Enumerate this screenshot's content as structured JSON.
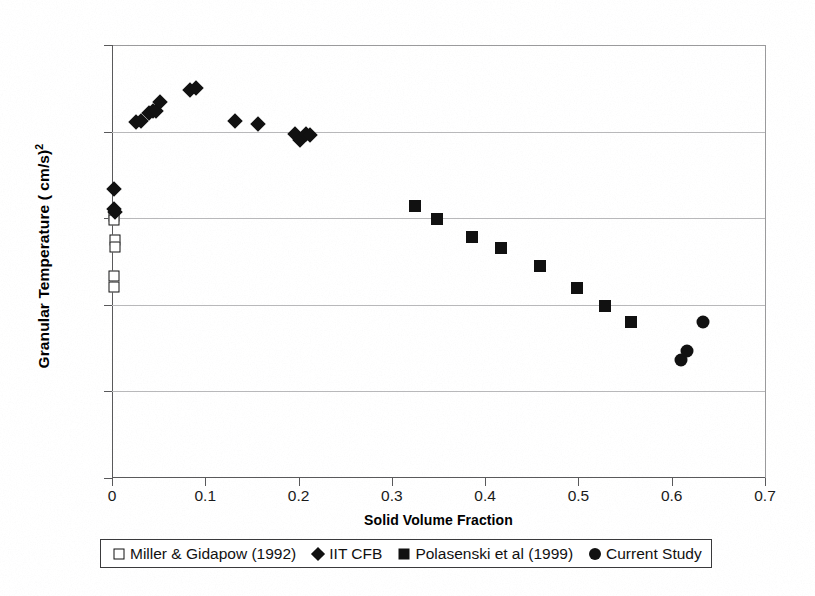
{
  "chart_data": {
    "type": "scatter",
    "title": "",
    "xlabel": "Solid Volume Fraction",
    "ylabel": "Granular Temperature ( cm/s)",
    "ylabel_exponent": "2",
    "xlim": [
      0,
      0.7
    ],
    "ylim": [
      1,
      100000
    ],
    "yscale": "log",
    "xscale": "linear",
    "grid": "horizontal",
    "legend_position": "below-plot",
    "xticks": [
      "0",
      "0.1",
      "0.2",
      "0.3",
      "0.4",
      "0.5",
      "0.6",
      "0.7"
    ],
    "xtick_values": [
      0,
      0.1,
      0.2,
      0.3,
      0.4,
      0.5,
      0.6,
      0.7
    ],
    "yticks": [
      "1",
      "10",
      "100",
      "1000",
      "10000",
      "100000"
    ],
    "ytick_values": [
      1,
      10,
      100,
      1000,
      10000,
      100000
    ],
    "marker_color": "#111111",
    "series": [
      {
        "name": "Miller & Gidapow (1992)",
        "marker": "open-square",
        "points": [
          [
            0.002,
            1050
          ],
          [
            0.002,
            960
          ],
          [
            0.003,
            560
          ],
          [
            0.003,
            470
          ],
          [
            0.002,
            215
          ],
          [
            0.002,
            160
          ]
        ]
      },
      {
        "name": "IIT CFB",
        "marker": "filled-diamond",
        "points": [
          [
            0.002,
            2150
          ],
          [
            0.002,
            1280
          ],
          [
            0.0035,
            1180
          ],
          [
            0.026,
            12800
          ],
          [
            0.031,
            13300
          ],
          [
            0.04,
            16500
          ],
          [
            0.044,
            17200
          ],
          [
            0.047,
            17100
          ],
          [
            0.051,
            22000
          ],
          [
            0.084,
            30500
          ],
          [
            0.09,
            32000
          ],
          [
            0.132,
            13100
          ],
          [
            0.156,
            12300
          ],
          [
            0.196,
            9400
          ],
          [
            0.202,
            7900
          ],
          [
            0.208,
            9300
          ],
          [
            0.212,
            9200
          ]
        ]
      },
      {
        "name": "Polasenski et al (1999)",
        "marker": "filled-square",
        "points": [
          [
            0.325,
            1400
          ],
          [
            0.348,
            980
          ],
          [
            0.386,
            600
          ],
          [
            0.417,
            455
          ],
          [
            0.459,
            280
          ],
          [
            0.499,
            155
          ],
          [
            0.529,
            96
          ],
          [
            0.556,
            63
          ]
        ]
      },
      {
        "name": "Current Study",
        "marker": "filled-circle",
        "points": [
          [
            0.61,
            23
          ],
          [
            0.616,
            29
          ],
          [
            0.634,
            63
          ]
        ]
      }
    ]
  },
  "legend": {
    "entries": [
      {
        "label": "Miller & Gidapow (1992)",
        "marker": "open-square"
      },
      {
        "label": "IIT CFB",
        "marker": "filled-diamond"
      },
      {
        "label": "Polasenski et al (1999)",
        "marker": "filled-square"
      },
      {
        "label": "Current Study",
        "marker": "filled-circle"
      }
    ]
  }
}
